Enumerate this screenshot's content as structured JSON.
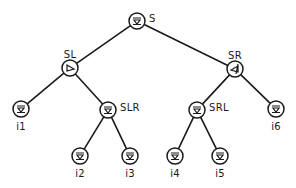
{
  "diagram": {
    "type": "binary-tree",
    "colors": {
      "stroke": "#1a1a1a",
      "background": "#ffffff"
    },
    "nodes": [
      {
        "id": "S",
        "label": "S",
        "x": 137,
        "y": 21,
        "label_dx": 12,
        "label_dy": -2,
        "label_anchor": "start",
        "glyph": "down-triangle"
      },
      {
        "id": "SL",
        "label": "SL",
        "x": 70,
        "y": 68,
        "label_dx": 0,
        "label_dy": -13,
        "label_anchor": "middle",
        "glyph": "right-triangle"
      },
      {
        "id": "SR",
        "label": "SR",
        "x": 235,
        "y": 69,
        "label_dx": 0,
        "label_dy": -13,
        "label_anchor": "middle",
        "glyph": "left-triangle"
      },
      {
        "id": "i1",
        "label": "i1",
        "x": 21,
        "y": 109,
        "label_dx": 0,
        "label_dy": 18,
        "label_anchor": "middle",
        "glyph": "down-triangle"
      },
      {
        "id": "SLR",
        "label": "SLR",
        "x": 108,
        "y": 110,
        "label_dx": 12,
        "label_dy": -2,
        "label_anchor": "start",
        "glyph": "down-triangle"
      },
      {
        "id": "SRL",
        "label": "SRL",
        "x": 197,
        "y": 110,
        "label_dx": 12,
        "label_dy": -2,
        "label_anchor": "start",
        "glyph": "down-triangle"
      },
      {
        "id": "i6",
        "label": "i6",
        "x": 276,
        "y": 109,
        "label_dx": 0,
        "label_dy": 18,
        "label_anchor": "middle",
        "glyph": "down-triangle"
      },
      {
        "id": "i2",
        "label": "i2",
        "x": 80,
        "y": 156,
        "label_dx": 0,
        "label_dy": 18,
        "label_anchor": "middle",
        "glyph": "down-triangle"
      },
      {
        "id": "i3",
        "label": "i3",
        "x": 130,
        "y": 156,
        "label_dx": 0,
        "label_dy": 18,
        "label_anchor": "middle",
        "glyph": "down-triangle"
      },
      {
        "id": "i4",
        "label": "i4",
        "x": 175,
        "y": 156,
        "label_dx": 0,
        "label_dy": 18,
        "label_anchor": "middle",
        "glyph": "down-triangle"
      },
      {
        "id": "i5",
        "label": "i5",
        "x": 220,
        "y": 156,
        "label_dx": 0,
        "label_dy": 18,
        "label_anchor": "middle",
        "glyph": "down-triangle"
      }
    ],
    "edges": [
      {
        "from": "S",
        "to": "SL"
      },
      {
        "from": "S",
        "to": "SR"
      },
      {
        "from": "SL",
        "to": "i1"
      },
      {
        "from": "SL",
        "to": "SLR"
      },
      {
        "from": "SLR",
        "to": "i2"
      },
      {
        "from": "SLR",
        "to": "i3"
      },
      {
        "from": "SR",
        "to": "SRL"
      },
      {
        "from": "SR",
        "to": "i6"
      },
      {
        "from": "SRL",
        "to": "i4"
      },
      {
        "from": "SRL",
        "to": "i5"
      }
    ],
    "node_radius": 8
  }
}
